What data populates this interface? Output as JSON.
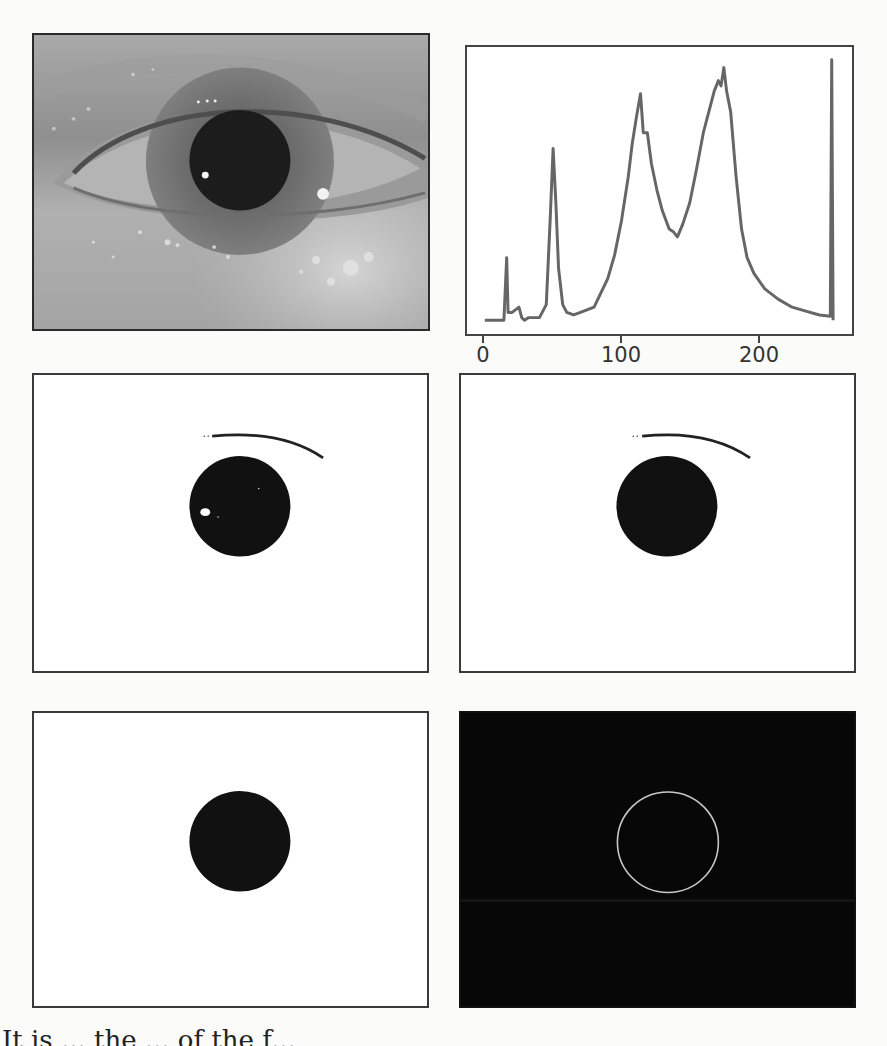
{
  "figure": {
    "panels": [
      {
        "id": "a",
        "label": "Original near-infrared eye image",
        "type": "photo"
      },
      {
        "id": "b",
        "label": "Grayscale intensity histogram",
        "type": "histogram"
      },
      {
        "id": "c",
        "label": "Binarized image with eyelash and reflection spot",
        "type": "binary"
      },
      {
        "id": "d",
        "label": "Binarized image after reflection removal",
        "type": "binary"
      },
      {
        "id": "e",
        "label": "Isolated pupil region",
        "type": "binary"
      },
      {
        "id": "f",
        "label": "Detected pupil boundary edge",
        "type": "edge"
      }
    ],
    "colors": {
      "histogram_line": "#666666",
      "edge_circle": "#c8c8c8",
      "pupil": "#111111"
    }
  },
  "histogram": {
    "x_ticks": [
      "0",
      "100",
      "200"
    ]
  },
  "chart_data": {
    "type": "line",
    "title": "",
    "xlabel": "",
    "ylabel": "",
    "xlim": [
      0,
      255
    ],
    "ylim": [
      0,
      1
    ],
    "grid": false,
    "x_ticks": [
      0,
      100,
      200
    ],
    "y_ticks": [],
    "series": [
      {
        "name": "pixel intensity frequency (relative)",
        "x": [
          0,
          14,
          16,
          17,
          20,
          25,
          27,
          29,
          32,
          40,
          45,
          48,
          50,
          52,
          54,
          57,
          60,
          65,
          70,
          80,
          90,
          95,
          100,
          105,
          108,
          111,
          114,
          116,
          119,
          122,
          126,
          130,
          135,
          138,
          141,
          145,
          150,
          155,
          160,
          165,
          168,
          171,
          173,
          175,
          177,
          180,
          184,
          188,
          192,
          197,
          205,
          215,
          225,
          235,
          245,
          253,
          254,
          255
        ],
        "y": [
          0.0,
          0.0,
          0.24,
          0.03,
          0.03,
          0.05,
          0.01,
          0.0,
          0.01,
          0.01,
          0.06,
          0.4,
          0.66,
          0.45,
          0.2,
          0.06,
          0.03,
          0.02,
          0.03,
          0.05,
          0.16,
          0.25,
          0.38,
          0.55,
          0.68,
          0.78,
          0.87,
          0.72,
          0.72,
          0.6,
          0.5,
          0.42,
          0.35,
          0.34,
          0.32,
          0.37,
          0.45,
          0.58,
          0.72,
          0.82,
          0.88,
          0.92,
          0.9,
          0.97,
          0.88,
          0.8,
          0.55,
          0.35,
          0.24,
          0.18,
          0.12,
          0.08,
          0.05,
          0.035,
          0.02,
          0.015,
          1.0,
          0.0
        ]
      }
    ]
  },
  "caption": {
    "partial_text": "It is ... the ... of the f..."
  }
}
